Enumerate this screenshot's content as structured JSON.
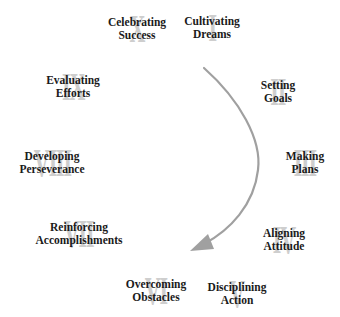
{
  "diagram": {
    "type": "cycle",
    "direction": "clockwise",
    "colors": {
      "text": "#1a1a1a",
      "numeral": "#c9c9c9",
      "arrow": "#a0a0a0",
      "background": "#ffffff"
    },
    "steps": [
      {
        "numeral": "I",
        "line1": "Cultivating",
        "line2": "Dreams"
      },
      {
        "numeral": "II",
        "line1": "Setting",
        "line2": "Goals"
      },
      {
        "numeral": "III",
        "line1": "Making",
        "line2": "Plans"
      },
      {
        "numeral": "IV",
        "line1": "Aligning",
        "line2": "Attitude"
      },
      {
        "numeral": "V",
        "line1": "Disciplining",
        "line2": "Action"
      },
      {
        "numeral": "VI",
        "line1": "Overcoming",
        "line2": "Obstacles"
      },
      {
        "numeral": "VII",
        "line1": "Reinforcing",
        "line2": "Accomplishments"
      },
      {
        "numeral": "VIII",
        "line1": "Developing",
        "line2": "Perseverance"
      },
      {
        "numeral": "IX",
        "line1": "Evaluating",
        "line2": "Efforts"
      },
      {
        "numeral": "X",
        "line1": "Celebrating",
        "line2": "Success"
      }
    ]
  }
}
